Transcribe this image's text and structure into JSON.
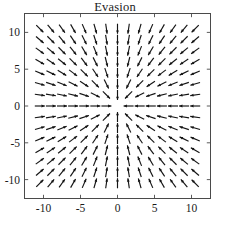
{
  "chart_data": {
    "type": "quiver",
    "title": "Evasion",
    "xlabel": "",
    "ylabel": "",
    "xlim": [
      -12.5,
      12.5
    ],
    "ylim": [
      -12.5,
      12.5
    ],
    "xticks": [
      -10,
      -5,
      0,
      5,
      10
    ],
    "yticks": [
      -10,
      -5,
      0,
      5,
      10
    ],
    "xtick_labels": [
      "-10",
      "-5",
      "0",
      "5",
      "10"
    ],
    "ytick_labels": [
      "-10",
      "-5",
      "0",
      "5",
      "10"
    ],
    "grid": false,
    "legend": null,
    "frame": true,
    "tick_direction": "in",
    "arrow_color": "#141414",
    "grid_nx": 15,
    "grid_ny": 15,
    "grid_x": [
      -10.5,
      -9.0,
      -7.5,
      -6.0,
      -4.5,
      -3.0,
      -1.5,
      0.0,
      1.5,
      3.0,
      4.5,
      6.0,
      7.5,
      9.0,
      10.5
    ],
    "grid_y": [
      -10.5,
      -9.0,
      -7.5,
      -6.0,
      -4.5,
      -3.0,
      -1.5,
      0.0,
      1.5,
      3.0,
      4.5,
      6.0,
      7.5,
      9.0,
      10.5
    ],
    "field_description": "Unit vectors pointing radially inward toward the origin (evasion/pursuit convergent node).",
    "field_formula": {
      "u": "-x / sqrt(x^2 + y^2)",
      "v": "-y / sqrt(x^2 + y^2)"
    },
    "arrow_length_px": 10.0,
    "arrow_head_px": 3.6,
    "origin_special": {
      "note": "Arrows immediately below the origin point upward; arrows along y=0 point horizontally toward x=0.",
      "singularity_at": [
        0,
        0
      ]
    }
  },
  "title": {
    "text": "Evasion"
  },
  "axes": {
    "x_labels": [
      "-10",
      "-5",
      "0",
      "5",
      "10"
    ],
    "y_labels": [
      "10",
      "5",
      "0",
      "-5",
      "-10"
    ]
  }
}
